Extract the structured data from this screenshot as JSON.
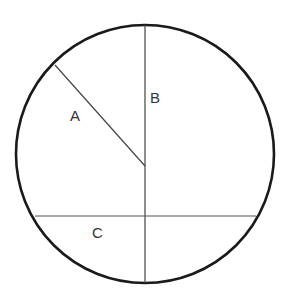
{
  "diagram": {
    "type": "circle-with-segments",
    "circle": {
      "cx": 145,
      "cy": 154,
      "r": 129,
      "stroke": "#1a1a1a"
    },
    "labels": {
      "a": "A",
      "b": "B",
      "c": "C"
    },
    "segments": [
      {
        "name": "A",
        "kind": "radius",
        "from": [
          55,
          65
        ],
        "to": [
          145,
          166
        ]
      },
      {
        "name": "B",
        "kind": "diameter",
        "from": [
          145,
          25
        ],
        "to": [
          145,
          283
        ]
      },
      {
        "name": "C",
        "kind": "chord",
        "from": [
          35,
          216
        ],
        "to": [
          256,
          216
        ]
      }
    ]
  }
}
